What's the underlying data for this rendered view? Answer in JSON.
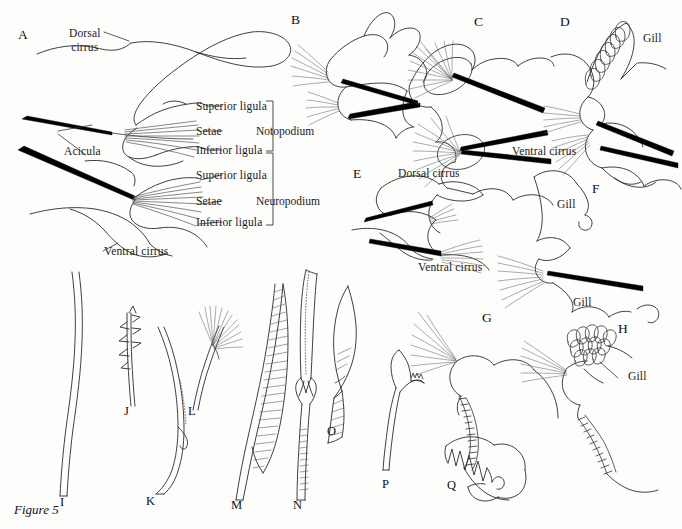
{
  "figure": {
    "caption": "Figure 5",
    "background_color": "#fdfdfc",
    "ink_color": "#1a1a1a",
    "acicula_color": "#000000"
  },
  "panels": [
    {
      "id": "A",
      "letter": "A"
    },
    {
      "id": "B",
      "letter": "B"
    },
    {
      "id": "C",
      "letter": "C"
    },
    {
      "id": "D",
      "letter": "D"
    },
    {
      "id": "E",
      "letter": "E"
    },
    {
      "id": "F",
      "letter": "F"
    },
    {
      "id": "G",
      "letter": "G"
    },
    {
      "id": "H",
      "letter": "H"
    }
  ],
  "setae": [
    {
      "id": "I",
      "letter": "I"
    },
    {
      "id": "J",
      "letter": "J"
    },
    {
      "id": "K",
      "letter": "K"
    },
    {
      "id": "L",
      "letter": "L"
    },
    {
      "id": "M",
      "letter": "M"
    },
    {
      "id": "N",
      "letter": "N"
    },
    {
      "id": "O",
      "letter": "O"
    },
    {
      "id": "P",
      "letter": "P"
    },
    {
      "id": "Q",
      "letter": "Q"
    }
  ],
  "labels": {
    "panel_a": {
      "dorsal_cirrus_line1": "Dorsal",
      "dorsal_cirrus_line2": "cirrus",
      "acicula": "Acicula",
      "ventral_cirrus": "Ventral cirrus",
      "superior_ligula_noto": "Superior ligula",
      "setae_noto": "Setae",
      "inferior_ligula_noto": "Inferior ligula",
      "superior_ligula_neuro": "Superior ligula",
      "setae_neuro": "Setae",
      "inferior_ligula_neuro": "Inferior ligula",
      "notopodium": "Notopodium",
      "neuropodium": "Neuropodium"
    },
    "panel_d": {
      "gill": "Gill",
      "ventral_cirrus": "Ventral cirrus"
    },
    "panel_e": {
      "dorsal_cirrus": "Dorsal cirrus",
      "ventral_cirrus": "Ventral cirrus"
    },
    "panel_f": {
      "gill_upper": "Gill",
      "gill_lower": "Gill"
    },
    "panel_h": {
      "gill": "Gill"
    }
  }
}
